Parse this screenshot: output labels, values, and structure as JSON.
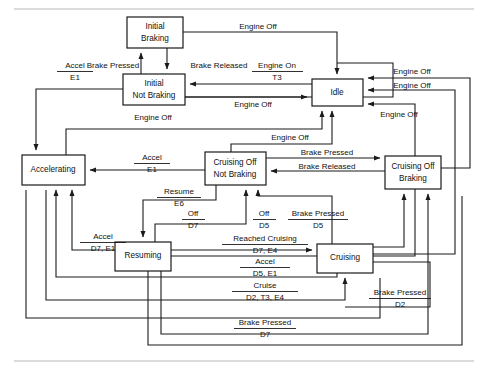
{
  "diagram": {
    "type": "state-transition-diagram",
    "canvas": {
      "width": 488,
      "height": 372
    },
    "colors": {
      "stroke": "#1a1a1a",
      "box_fill": "#ffffff",
      "background": "#ffffff",
      "frame_rule": "#b8b8b8"
    },
    "states": [
      {
        "id": "initial_braking",
        "lines": [
          "Initial",
          "Braking"
        ],
        "x": 127,
        "y": 17,
        "w": 56,
        "h": 31
      },
      {
        "id": "initial_not_braking",
        "lines": [
          "Initial",
          "Not Braking"
        ],
        "x": 123,
        "y": 74,
        "w": 62,
        "h": 31
      },
      {
        "id": "idle",
        "lines": [
          "Idle"
        ],
        "x": 312,
        "y": 79,
        "w": 51,
        "h": 27
      },
      {
        "id": "accelerating",
        "lines": [
          "Accelerating"
        ],
        "x": 22,
        "y": 155,
        "w": 63,
        "h": 30
      },
      {
        "id": "cruising_off_not_braking",
        "lines": [
          "Cruising Off",
          "Not Braking"
        ],
        "x": 205,
        "y": 152,
        "w": 61,
        "h": 33
      },
      {
        "id": "cruising_off_braking",
        "lines": [
          "Cruising Off",
          "Braking"
        ],
        "x": 385,
        "y": 156,
        "w": 56,
        "h": 33
      },
      {
        "id": "resuming",
        "lines": [
          "Resuming"
        ],
        "x": 115,
        "y": 242,
        "w": 56,
        "h": 29
      },
      {
        "id": "cruising",
        "lines": [
          "Cruising"
        ],
        "x": 317,
        "y": 244,
        "w": 56,
        "h": 29
      }
    ],
    "transitions": [
      {
        "id": "t-brake-pressed-initial",
        "event": "Brake Pressed",
        "action": "",
        "from": "initial_not_braking",
        "to": "initial_braking"
      },
      {
        "id": "t-brake-released-initial",
        "event": "Brake Released",
        "action": "",
        "from": "initial_braking",
        "to": "initial_not_braking"
      },
      {
        "id": "t-engine-off-ib-idle",
        "event": "Engine Off",
        "action": "",
        "from": "initial_braking",
        "to": "idle"
      },
      {
        "id": "t-engine-on",
        "event": "Engine On",
        "action": "T3",
        "from": "idle",
        "to": "initial_not_braking"
      },
      {
        "id": "t-engine-off-inb-idle",
        "event": "Engine Off",
        "action": "",
        "from": "initial_not_braking",
        "to": "idle"
      },
      {
        "id": "t-accel-inb",
        "event": "Accel",
        "action": "E1",
        "from": "initial_not_braking",
        "to": "accelerating"
      },
      {
        "id": "t-engine-off-accel",
        "event": "Engine Off",
        "action": "",
        "from": "accelerating",
        "to": "idle"
      },
      {
        "id": "t-engine-off-mid",
        "event": "Engine Off",
        "action": "",
        "from": "cruising_off_not_braking",
        "to": "idle"
      },
      {
        "id": "t-accel-conb",
        "event": "Accel",
        "action": "E1",
        "from": "cruising_off_not_braking",
        "to": "accelerating"
      },
      {
        "id": "t-brake-pressed-co",
        "event": "Brake Pressed",
        "action": "",
        "from": "cruising_off_not_braking",
        "to": "cruising_off_braking"
      },
      {
        "id": "t-brake-released-co",
        "event": "Brake Released",
        "action": "",
        "from": "cruising_off_braking",
        "to": "cruising_off_not_braking"
      },
      {
        "id": "t-engine-off-cob",
        "event": "Engine Off",
        "action": "",
        "from": "cruising_off_braking",
        "to": "idle"
      },
      {
        "id": "t-engine-off-right-1",
        "event": "Engine Off",
        "action": "",
        "from": "cruising",
        "to": "idle"
      },
      {
        "id": "t-engine-off-right-2",
        "event": "Engine Off",
        "action": "",
        "from": "resuming",
        "to": "idle"
      },
      {
        "id": "t-resume",
        "event": "Resume",
        "action": "E6",
        "from": "cruising_off_not_braking",
        "to": "resuming"
      },
      {
        "id": "t-off-d7",
        "event": "Off",
        "action": "D7",
        "from": "resuming",
        "to": "cruising_off_not_braking"
      },
      {
        "id": "t-accel-d7-e1",
        "event": "Accel",
        "action": "D7, E1",
        "from": "resuming",
        "to": "accelerating"
      },
      {
        "id": "t-reached-cruising",
        "event": "Reached Cruising",
        "action": "D7, E4",
        "from": "resuming",
        "to": "cruising"
      },
      {
        "id": "t-off-d5",
        "event": "Off",
        "action": "D5",
        "from": "cruising",
        "to": "cruising_off_not_braking"
      },
      {
        "id": "t-brake-pressed-d5",
        "event": "Brake Pressed",
        "action": "D5",
        "from": "cruising",
        "to": "cruising_off_braking"
      },
      {
        "id": "t-accel-d5-e1",
        "event": "Accel",
        "action": "D5, E1",
        "from": "cruising",
        "to": "accelerating"
      },
      {
        "id": "t-cruise",
        "event": "Cruise",
        "action": "D2, T3, E4",
        "from": "accelerating",
        "to": "cruising"
      },
      {
        "id": "t-brake-pressed-d2",
        "event": "Brake Pressed",
        "action": "D2",
        "from": "cruising",
        "to": "cruising"
      },
      {
        "id": "t-brake-pressed-d7",
        "event": "Brake Pressed",
        "action": "D7",
        "from": "resuming",
        "to": "cruising_off_braking"
      }
    ],
    "edge_labels": [
      {
        "id": "lbl-accel-e1-top",
        "event": "Accel",
        "action": "E1",
        "x": 75,
        "y": 68
      },
      {
        "id": "lbl-brake-pressed-top",
        "event": "Brake Pressed",
        "action": "",
        "x": 109,
        "y": 68
      },
      {
        "id": "lbl-brake-released-top",
        "event": "Brake Released",
        "action": "",
        "x": 215,
        "y": 68
      },
      {
        "id": "lbl-engine-off-ib",
        "event": "Engine Off",
        "action": "",
        "x": 256,
        "y": 39
      },
      {
        "id": "lbl-engine-on",
        "event": "Engine On",
        "action": "T3",
        "from_state": "idle",
        "x": 276,
        "y": 68
      },
      {
        "id": "lbl-engine-off-inb",
        "event": "Engine Off",
        "action": "",
        "x": 253,
        "y": 104
      },
      {
        "id": "lbl-engine-off-accel",
        "event": "Engine Off",
        "action": "",
        "x": 152,
        "y": 120
      },
      {
        "id": "lbl-engine-off-mid",
        "event": "Engine Off",
        "action": "",
        "x": 288,
        "y": 136
      },
      {
        "id": "lbl-engine-off-r1",
        "event": "Engine Off",
        "action": "",
        "x": 411,
        "y": 73
      },
      {
        "id": "lbl-engine-off-r2",
        "event": "Engine Off",
        "action": "",
        "x": 411,
        "y": 88
      },
      {
        "id": "lbl-engine-off-r3",
        "event": "Engine Off",
        "action": "",
        "x": 398,
        "y": 114
      },
      {
        "id": "lbl-accel-e1-mid",
        "event": "Accel",
        "action": "E1",
        "x": 152,
        "y": 158
      },
      {
        "id": "lbl-brake-pressed-co",
        "event": "Brake Pressed",
        "action": "",
        "x": 327,
        "y": 159
      },
      {
        "id": "lbl-brake-released-co",
        "event": "Brake Released",
        "action": "",
        "x": 327,
        "y": 173
      },
      {
        "id": "lbl-resume-e6",
        "event": "Resume",
        "action": "E6",
        "x": 177,
        "y": 192
      },
      {
        "id": "lbl-off-d7",
        "event": "Off",
        "action": "D7",
        "x": 191,
        "y": 214
      },
      {
        "id": "lbl-off-d5",
        "event": "Off",
        "action": "D5",
        "x": 262,
        "y": 216
      },
      {
        "id": "lbl-brake-pressed-d5",
        "event": "Brake Pressed",
        "action": "D5",
        "x": 315,
        "y": 216
      },
      {
        "id": "lbl-accel-d7-e1",
        "event": "Accel",
        "action": "D7, E1",
        "x": 103,
        "y": 239
      },
      {
        "id": "lbl-reached-cruising",
        "event": "Reached Cruising",
        "action": "D7, E4",
        "x": 262,
        "y": 240
      },
      {
        "id": "lbl-accel-d5-e1",
        "event": "Accel",
        "action": "D5, E1",
        "x": 262,
        "y": 264
      },
      {
        "id": "lbl-cruise",
        "event": "Cruise",
        "action": "D2, T3, E4",
        "x": 262,
        "y": 288
      },
      {
        "id": "lbl-brake-pressed-d2",
        "event": "Brake Pressed",
        "action": "D2",
        "x": 400,
        "y": 295
      },
      {
        "id": "lbl-brake-pressed-d7",
        "event": "Brake Pressed",
        "action": "D7",
        "x": 263,
        "y": 325
      }
    ]
  }
}
